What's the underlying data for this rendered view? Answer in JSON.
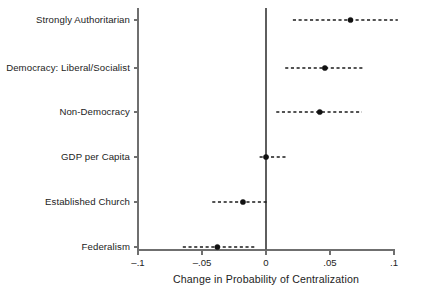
{
  "chart_data": {
    "type": "scatter",
    "title": "",
    "xlabel": "Change in Probability of Centralization",
    "ylabel": "",
    "xlim": [
      -0.1,
      0.1
    ],
    "xticks": [
      -0.1,
      -0.05,
      0,
      0.05,
      0.1
    ],
    "xticklabels": [
      "–.1",
      "–.05",
      "0",
      ".05",
      ".1"
    ],
    "grid": false,
    "legend": null,
    "zero_reference_line": 0,
    "orientation": "horizontal",
    "categories": [
      "Strongly Authoritarian",
      "Democracy: Liberal/Socialist",
      "Non-Democracy",
      "GDP per Capita",
      "Established Church",
      "Federalism"
    ],
    "values": [
      0.066,
      0.046,
      0.042,
      0.0,
      -0.018,
      -0.038
    ],
    "ci_low": [
      0.021,
      0.015,
      0.008,
      -0.005,
      -0.042,
      -0.065
    ],
    "ci_high": [
      0.103,
      0.077,
      0.075,
      0.017,
      0.002,
      -0.009
    ],
    "points": [
      {
        "label": "Strongly Authoritarian",
        "estimate": 0.066,
        "ci_low": 0.021,
        "ci_high": 0.103
      },
      {
        "label": "Democracy: Liberal/Socialist",
        "estimate": 0.046,
        "ci_low": 0.015,
        "ci_high": 0.077
      },
      {
        "label": "Non-Democracy",
        "estimate": 0.042,
        "ci_low": 0.008,
        "ci_high": 0.075
      },
      {
        "label": "GDP per Capita",
        "estimate": 0.0,
        "ci_low": -0.005,
        "ci_high": 0.017
      },
      {
        "label": "Established Church",
        "estimate": -0.018,
        "ci_low": -0.042,
        "ci_high": 0.002
      },
      {
        "label": "Federalism",
        "estimate": -0.038,
        "ci_low": -0.065,
        "ci_high": -0.009
      }
    ],
    "colors": {
      "marker": "#111111",
      "interval": "#1b1b1b",
      "axis": "#6f6f6f",
      "zero_line": "#5e5e5e",
      "text": "#232323",
      "background": "#ffffff"
    }
  }
}
